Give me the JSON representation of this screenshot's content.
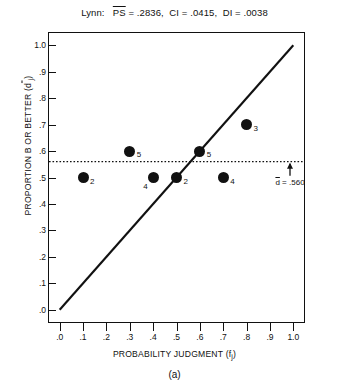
{
  "chart_data": {
    "type": "scatter",
    "title_parts": {
      "subject": "Lynn:",
      "ps_symbol": "PS",
      "ps_value": "= .2836,",
      "ci": "CI = .0415,",
      "di": "DI = .0038"
    },
    "xlabel": "PROBABILITY JUDGMENT (f",
    "xlabel_sub": "j",
    "xlabel_end": ")",
    "ylabel": "PROPORTION B OR BETTER (d",
    "ylabel_sub": "j",
    "ylabel_end": ")",
    "xlim": [
      -0.05,
      1.05
    ],
    "ylim": [
      -0.05,
      1.05
    ],
    "xticks": [
      ".0",
      ".1",
      ".2",
      ".3",
      ".4",
      ".5",
      ".6",
      ".7",
      ".8",
      ".9",
      "1.0"
    ],
    "yticks": [
      "1.0",
      ".9",
      ".8",
      ".7",
      ".6",
      ".5",
      ".4",
      ".3",
      ".2",
      ".1",
      ".0"
    ],
    "xtick_values": [
      0.0,
      0.1,
      0.2,
      0.3,
      0.4,
      0.5,
      0.6,
      0.7,
      0.8,
      0.9,
      1.0
    ],
    "ytick_values": [
      1.0,
      0.9,
      0.8,
      0.7,
      0.6,
      0.5,
      0.4,
      0.3,
      0.2,
      0.1,
      0.0
    ],
    "grid": false,
    "legend": null,
    "points": [
      {
        "x": 0.1,
        "y": 0.5,
        "label": "2",
        "label_pos": "right"
      },
      {
        "x": 0.3,
        "y": 0.6,
        "label": "5",
        "label_pos": "right"
      },
      {
        "x": 0.4,
        "y": 0.5,
        "label": "4",
        "label_pos": "below-left"
      },
      {
        "x": 0.5,
        "y": 0.5,
        "label": "2",
        "label_pos": "right"
      },
      {
        "x": 0.6,
        "y": 0.6,
        "label": "5",
        "label_pos": "right"
      },
      {
        "x": 0.7,
        "y": 0.5,
        "label": "4",
        "label_pos": "right"
      },
      {
        "x": 0.8,
        "y": 0.7,
        "label": "3",
        "label_pos": "right"
      }
    ],
    "identity_line": {
      "from": [
        0.0,
        0.0
      ],
      "to": [
        1.0,
        1.0
      ],
      "style": "solid"
    },
    "reference_line": {
      "y": 0.56,
      "style": "dotted"
    },
    "annotation": {
      "dbar_symbol": "d",
      "text": "= .560",
      "full": "d = .560",
      "arrow": "up-arrow"
    },
    "colors": {
      "marker": "#111111",
      "line": "#111111",
      "axis": "#111111",
      "background": "#ffffff"
    }
  },
  "caption": {
    "label": "(a)"
  }
}
